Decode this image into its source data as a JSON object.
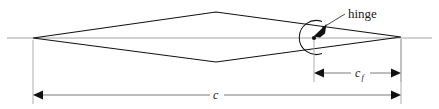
{
  "figure": {
    "background_color": "#ffffff",
    "width": 439,
    "height": 109,
    "line_color": "#111111",
    "chord_axis_color": "#9a9a9a",
    "dimension_color": "#6e6e6e",
    "extension_color": "#a6a6a6"
  },
  "annotations": {
    "hinge_label": "hinge",
    "chord_symbol": "c",
    "flap_chord_symbol": "c",
    "flap_chord_subscript": "f"
  },
  "geometry": {
    "leading_edge": {
      "x": 33,
      "y": 38
    },
    "trailing_edge": {
      "x": 401,
      "y": 37
    },
    "upper_apex": {
      "x": 216,
      "y": 12
    },
    "lower_apex": {
      "x": 216,
      "y": 62
    },
    "hinge_point": {
      "x": 314,
      "y": 37
    },
    "chord_axis_y": 38,
    "chord_axis_start_x": 7,
    "chord_axis_end_x": 432,
    "hinge_arc_radius": 17
  },
  "dimensions": [
    {
      "name": "flap-chord",
      "symbol": "c",
      "subscript": "f",
      "y": 73,
      "x_start": 314,
      "x_end": 401,
      "label_x": 360,
      "label_y": 77
    },
    {
      "name": "chord",
      "symbol": "c",
      "subscript": "",
      "y": 95,
      "x_start": 33,
      "x_end": 401,
      "label_x": 217,
      "label_y": 99
    }
  ],
  "icons": {
    "hinge_pointer": "arrowhead-icon",
    "dimension_arrow": "arrowhead-icon"
  }
}
